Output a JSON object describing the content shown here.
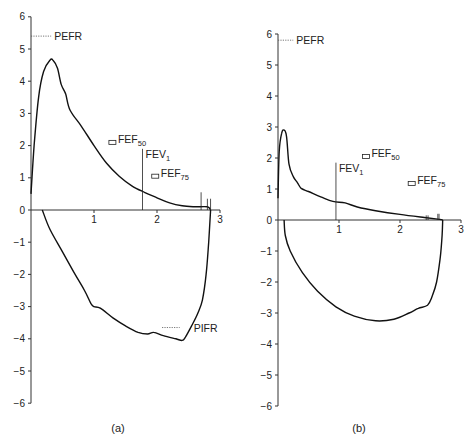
{
  "chart_data": [
    {
      "type": "line",
      "id": "a",
      "title": "",
      "caption": "(a)",
      "xlabel": "",
      "ylabel": "",
      "xlim": [
        0,
        3
      ],
      "ylim": [
        -6,
        6
      ],
      "x_ticks": [
        "1",
        "2",
        "3"
      ],
      "y_ticks": [
        "6",
        "5",
        "4",
        "3",
        "2",
        "1",
        "0",
        "−1",
        "−2",
        "−3",
        "−4",
        "−5",
        "−6"
      ],
      "grid": false,
      "series": [
        {
          "name": "expiratory",
          "points": [
            [
              0,
              0.5
            ],
            [
              0.05,
              2
            ],
            [
              0.12,
              3.5
            ],
            [
              0.2,
              4.3
            ],
            [
              0.3,
              4.65
            ],
            [
              0.35,
              4.65
            ],
            [
              0.42,
              4.4
            ],
            [
              0.48,
              3.9
            ],
            [
              0.55,
              3.6
            ],
            [
              0.62,
              3.1
            ],
            [
              0.8,
              2.6
            ],
            [
              1.0,
              2.0
            ],
            [
              1.2,
              1.45
            ],
            [
              1.4,
              1.05
            ],
            [
              1.6,
              0.75
            ],
            [
              1.8,
              0.55
            ],
            [
              2.0,
              0.38
            ],
            [
              2.2,
              0.22
            ],
            [
              2.4,
              0.13
            ],
            [
              2.6,
              0.1
            ],
            [
              2.8,
              0.1
            ],
            [
              2.85,
              0
            ]
          ]
        },
        {
          "name": "inspiratory",
          "points": [
            [
              0.18,
              0
            ],
            [
              0.3,
              -0.6
            ],
            [
              0.5,
              -1.3
            ],
            [
              0.7,
              -2
            ],
            [
              0.85,
              -2.5
            ],
            [
              0.95,
              -2.9
            ],
            [
              1.0,
              -3.0
            ],
            [
              1.1,
              -3.05
            ],
            [
              1.3,
              -3.35
            ],
            [
              1.5,
              -3.6
            ],
            [
              1.7,
              -3.8
            ],
            [
              1.85,
              -3.85
            ],
            [
              1.95,
              -3.8
            ],
            [
              2.1,
              -3.9
            ],
            [
              2.3,
              -4.0
            ],
            [
              2.4,
              -4.05
            ],
            [
              2.45,
              -3.95
            ],
            [
              2.55,
              -3.6
            ],
            [
              2.65,
              -3.2
            ],
            [
              2.72,
              -2.8
            ],
            [
              2.78,
              -2
            ],
            [
              2.82,
              -1
            ],
            [
              2.85,
              0
            ]
          ]
        }
      ],
      "annotations": [
        {
          "label": "PEFR",
          "sub": "",
          "kind": "dotted-tick",
          "x": 0,
          "y": 5.4,
          "x_end": 0.32
        },
        {
          "label": "FEF",
          "sub": "50",
          "kind": "box",
          "x": 1.3,
          "y": 2.1
        },
        {
          "label": "FEV",
          "sub": "1",
          "kind": "vline",
          "x": 1.77,
          "y": 1.9
        },
        {
          "label": "FEF",
          "sub": "75",
          "kind": "box",
          "x": 1.98,
          "y": 1.05
        },
        {
          "label": "PIFR",
          "sub": "",
          "kind": "dotted-tick-right",
          "x": 2.08,
          "y": -3.65,
          "x_end": 2.36
        }
      ],
      "end_markers": [
        {
          "x": 2.7,
          "height": 0.55
        },
        {
          "x": 2.8,
          "height": 0.35
        },
        {
          "x": 2.85,
          "height": 0.35
        }
      ]
    },
    {
      "type": "line",
      "id": "b",
      "title": "",
      "caption": "(b)",
      "xlabel": "",
      "ylabel": "",
      "xlim": [
        0,
        3
      ],
      "ylim": [
        -6,
        6
      ],
      "x_ticks": [
        "1",
        "2",
        "3"
      ],
      "y_ticks": [
        "6",
        "5",
        "4",
        "3",
        "2",
        "1",
        "0",
        "−1",
        "−2",
        "−3",
        "−4",
        "−5",
        "−6"
      ],
      "grid": false,
      "series": [
        {
          "name": "expiratory",
          "points": [
            [
              0,
              0.7
            ],
            [
              0.02,
              2.2
            ],
            [
              0.06,
              2.8
            ],
            [
              0.1,
              2.9
            ],
            [
              0.14,
              2.7
            ],
            [
              0.18,
              1.8
            ],
            [
              0.25,
              1.4
            ],
            [
              0.32,
              1.2
            ],
            [
              0.38,
              1.02
            ],
            [
              0.5,
              0.92
            ],
            [
              0.7,
              0.75
            ],
            [
              0.9,
              0.6
            ],
            [
              1.1,
              0.55
            ],
            [
              1.3,
              0.42
            ],
            [
              1.6,
              0.3
            ],
            [
              2.0,
              0.18
            ],
            [
              2.4,
              0.08
            ],
            [
              2.65,
              0.02
            ],
            [
              2.7,
              0
            ]
          ]
        },
        {
          "name": "inspiratory",
          "points": [
            [
              0.1,
              0
            ],
            [
              0.12,
              -0.5
            ],
            [
              0.2,
              -1
            ],
            [
              0.4,
              -1.7
            ],
            [
              0.65,
              -2.3
            ],
            [
              0.95,
              -2.8
            ],
            [
              1.25,
              -3.1
            ],
            [
              1.6,
              -3.25
            ],
            [
              1.9,
              -3.2
            ],
            [
              2.15,
              -3.0
            ],
            [
              2.3,
              -2.85
            ],
            [
              2.45,
              -2.75
            ],
            [
              2.52,
              -2.5
            ],
            [
              2.6,
              -2
            ],
            [
              2.66,
              -1.2
            ],
            [
              2.69,
              -0.5
            ],
            [
              2.7,
              0
            ]
          ]
        }
      ],
      "annotations": [
        {
          "label": "PEFR",
          "sub": "",
          "kind": "dotted-tick",
          "x": 0,
          "y": 5.8,
          "x_end": 0.25
        },
        {
          "label": "FEF",
          "sub": "50",
          "kind": "box",
          "x": 1.45,
          "y": 2.05
        },
        {
          "label": "FEV",
          "sub": "1",
          "kind": "vline",
          "x": 0.95,
          "y": 1.85
        },
        {
          "label": "FEF",
          "sub": "75",
          "kind": "box",
          "x": 2.2,
          "y": 1.18
        }
      ],
      "end_markers": [
        {
          "x": 2.43,
          "height": 0.15
        },
        {
          "x": 2.46,
          "height": 0.15
        },
        {
          "x": 2.62,
          "height": 0.2
        },
        {
          "x": 2.64,
          "height": 0.2
        }
      ]
    }
  ]
}
